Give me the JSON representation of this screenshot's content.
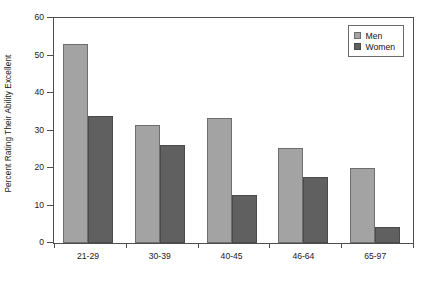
{
  "chart_data": {
    "type": "bar",
    "title": "",
    "xlabel": "",
    "ylabel": "Percent Rating Their Ability Excellent",
    "categories": [
      "21-29",
      "30-39",
      "40-45",
      "46-64",
      "65-97"
    ],
    "series": [
      {
        "name": "Men",
        "color": "#a3a3a3",
        "values": [
          53.0,
          31.5,
          33.4,
          25.4,
          20.0
        ]
      },
      {
        "name": "Women",
        "color": "#606060",
        "values": [
          34.0,
          26.1,
          12.8,
          17.7,
          4.3
        ]
      }
    ],
    "ylim": [
      0,
      60
    ],
    "yticks": [
      0,
      10,
      20,
      30,
      40,
      50,
      60
    ],
    "ytick_labels": [
      "0",
      "10",
      "20",
      "30",
      "40",
      "50",
      "60"
    ],
    "grid": false,
    "legend_position": "top-right"
  },
  "legend": {
    "entries": [
      {
        "label": "Men"
      },
      {
        "label": "Women"
      }
    ]
  }
}
